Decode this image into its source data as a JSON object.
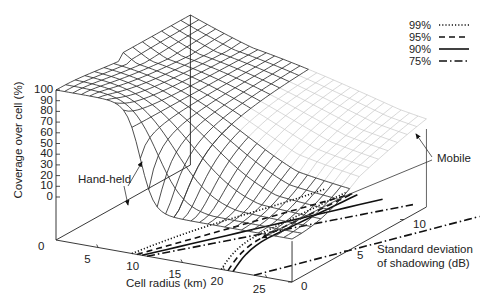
{
  "chart_data": {
    "type": "surface3d",
    "title": "",
    "xlabel": "Cell radius (km)",
    "ylabel": "Standard deviation of shadowing (dB)",
    "zlabel": "Coverage over cell (%)",
    "x_ticks": [
      "5",
      "10",
      "15",
      "20",
      "25"
    ],
    "x_tick_values": [
      5,
      10,
      15,
      20,
      25
    ],
    "y_ticks": [
      "0",
      "5",
      "10"
    ],
    "y_tick_values": [
      0,
      5,
      10
    ],
    "z_ticks": [
      "100",
      "90",
      "80",
      "70",
      "60",
      "50",
      "40",
      "30",
      "20",
      "10",
      "0"
    ],
    "z_tick_values": [
      100,
      90,
      80,
      70,
      60,
      50,
      40,
      30,
      20,
      10,
      0
    ],
    "floor_zero_label": "0",
    "xlim": [
      0,
      28
    ],
    "ylim": [
      0,
      12
    ],
    "zlim": [
      0,
      100
    ],
    "legend": [
      {
        "label": "99%",
        "style": "dotted"
      },
      {
        "label": "95%",
        "style": "dashed"
      },
      {
        "label": "90%",
        "style": "solid"
      },
      {
        "label": "75%",
        "style": "dash-dot"
      }
    ],
    "legend_position": "top-right",
    "annotations": [
      {
        "text": "Hand-held",
        "target": "lower-radius surface edge / hand-held contour group"
      },
      {
        "text": "Mobile",
        "target": "larger-radius surface edge / mobile contour group"
      }
    ],
    "contours_on_floor": {
      "hand_held": {
        "99%": [
          9,
          0
        ],
        "95%": [
          9.5,
          0
        ],
        "90%": [
          10,
          0
        ],
        "75%": [
          10.5,
          0
        ]
      },
      "mobile": {
        "99%": [
          19.5,
          0
        ],
        "95%": [
          20.5,
          0
        ],
        "90%": [
          21,
          0
        ],
        "75%": [
          24,
          0
        ]
      }
    },
    "grid": false
  }
}
